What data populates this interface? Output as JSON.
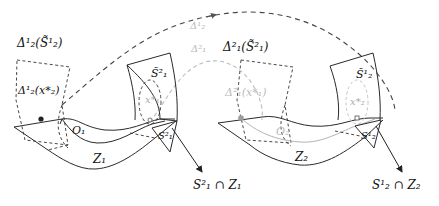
{
  "diagram": {
    "type": "mathematical-illustration",
    "left_scene": {
      "box_top_label": "Δ¹₂(S̃¹₂)",
      "box_inner_label": "Δ¹₂(x*₂)",
      "surface_label": "Z₁",
      "curve_label": "O₁",
      "tile_label": "S̃²₁",
      "point_label": "x*₁",
      "small_patch_label": "S²₁",
      "arrow_label": "S²₁ ∩ Z₁"
    },
    "right_scene": {
      "box_top_label": "Δ²₁(S̃²₁)",
      "box_inner_label": "Δ²₁(x*₁)",
      "surface_label": "Z₂",
      "curve_label": "O₂",
      "tile_label": "S̃¹₂",
      "point_label": "x*₂",
      "small_patch_label": "S¹₂",
      "arrow_label": "S¹₂ ∩ Z₂"
    },
    "connectors": {
      "outer_arc_label": "Δ¹₂",
      "inner_arc_label": "Δ²₁"
    },
    "colors": {
      "ink": "#2a2a2a",
      "faded": "#b8b8b8",
      "background": "#ffffff"
    }
  }
}
